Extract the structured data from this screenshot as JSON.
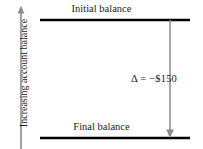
{
  "figure": {
    "background_color": "#ffffff",
    "width": 203,
    "height": 149
  },
  "y_axis": {
    "label": "Increasing account balance",
    "direction": "up",
    "color": "#8c8c8c",
    "line_x": 21,
    "top_y": 8,
    "bottom_y": 149
  },
  "levels": {
    "initial": {
      "label": "Initial balance",
      "y": 20,
      "x_start": 40,
      "x_end": 190,
      "color": "#000000",
      "thickness": 2.4
    },
    "final": {
      "label": "Final balance",
      "y": 138,
      "x_start": 40,
      "x_end": 190,
      "color": "#000000",
      "thickness": 2.4
    }
  },
  "delta_arrow": {
    "annotation": "Δ = −$150",
    "value": -150,
    "currency": "$",
    "symbol": "Δ",
    "x": 170,
    "y_start": 20,
    "y_end": 138,
    "direction": "down",
    "color": "#8c8c8c"
  }
}
